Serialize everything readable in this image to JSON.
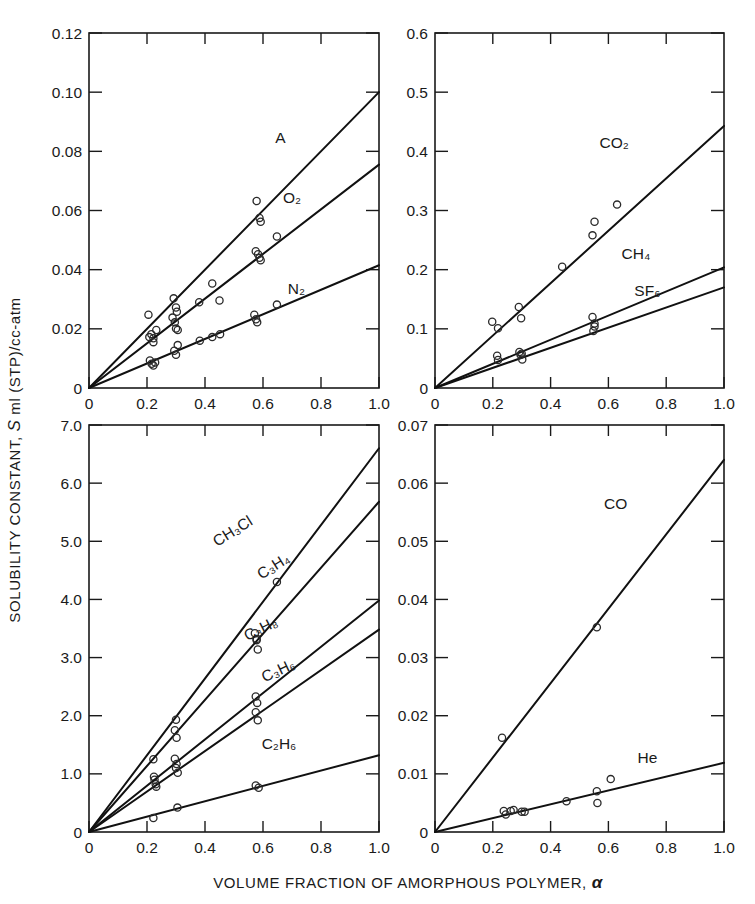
{
  "figure": {
    "xlabel_prefix": "VOLUME FRACTION OF AMORPHOUS POLYMER,",
    "xlabel_symbol": "α",
    "ylabel_part1": "SOLUBILITY CONSTANT,",
    "ylabel_symbol": "S",
    "ylabel_part2": "ml (STP)/cc-atm"
  },
  "chart_data": [
    {
      "id": "panel-top-left",
      "type": "scatter",
      "title": "",
      "xlabel": "VOLUME FRACTION OF AMORPHOUS POLYMER, α",
      "ylabel": "SOLUBILITY CONSTANT, S ml (STP)/cc-atm",
      "xlim": [
        0,
        1.0
      ],
      "ylim": [
        0,
        0.12
      ],
      "xticks": [
        0,
        0.2,
        0.4,
        0.6,
        0.8,
        1.0
      ],
      "xticklabels": [
        "0",
        "0.2",
        "0.4",
        "0.6",
        "0.8",
        "1.0"
      ],
      "yticks": [
        0,
        0.02,
        0.04,
        0.06,
        0.08,
        0.1,
        0.12
      ],
      "yticklabels": [
        "0",
        "0.02",
        "0.04",
        "0.06",
        "0.08",
        "0.10",
        "0.12"
      ],
      "grid": false,
      "legend_position": "inline-annotation",
      "series": [
        {
          "name": "A",
          "label": "A",
          "label_at": [
            0.66,
            0.083
          ],
          "fit_slope": 0.1,
          "fit_x": [
            0,
            1.0
          ],
          "fit_y": [
            0,
            0.1
          ],
          "points": [
            [
              0.205,
              0.0248
            ],
            [
              0.215,
              0.0182
            ],
            [
              0.222,
              0.0168
            ],
            [
              0.232,
              0.0196
            ],
            [
              0.292,
              0.0303
            ],
            [
              0.3,
              0.0272
            ],
            [
              0.303,
              0.0258
            ],
            [
              0.578,
              0.0632
            ],
            [
              0.588,
              0.0575
            ],
            [
              0.592,
              0.0562
            ]
          ]
        },
        {
          "name": "O2",
          "label": "O₂",
          "label_at": [
            0.7,
            0.0625
          ],
          "fit_slope": 0.0755,
          "fit_x": [
            0,
            1.0
          ],
          "fit_y": [
            0,
            0.0755
          ],
          "points": [
            [
              0.208,
              0.0172
            ],
            [
              0.222,
              0.0155
            ],
            [
              0.288,
              0.0238
            ],
            [
              0.296,
              0.0222
            ],
            [
              0.3,
              0.0201
            ],
            [
              0.306,
              0.0196
            ],
            [
              0.38,
              0.029
            ],
            [
              0.425,
              0.0353
            ],
            [
              0.45,
              0.0296
            ],
            [
              0.575,
              0.0462
            ],
            [
              0.583,
              0.0452
            ],
            [
              0.588,
              0.044
            ],
            [
              0.592,
              0.0432
            ],
            [
              0.648,
              0.0512
            ]
          ]
        },
        {
          "name": "N2",
          "label": "N₂",
          "label_at": [
            0.715,
            0.0318
          ],
          "fit_slope": 0.0415,
          "fit_x": [
            0,
            1.0
          ],
          "fit_y": [
            0,
            0.0415
          ],
          "points": [
            [
              0.21,
              0.0093
            ],
            [
              0.216,
              0.0082
            ],
            [
              0.222,
              0.0076
            ],
            [
              0.228,
              0.0086
            ],
            [
              0.294,
              0.0126
            ],
            [
              0.3,
              0.0112
            ],
            [
              0.306,
              0.0145
            ],
            [
              0.382,
              0.016
            ],
            [
              0.425,
              0.0172
            ],
            [
              0.452,
              0.0182
            ],
            [
              0.57,
              0.0248
            ],
            [
              0.576,
              0.0232
            ],
            [
              0.58,
              0.0222
            ],
            [
              0.648,
              0.0282
            ]
          ]
        }
      ]
    },
    {
      "id": "panel-top-right",
      "type": "scatter",
      "title": "",
      "xlabel": "VOLUME FRACTION OF AMORPHOUS POLYMER, α",
      "ylabel": "SOLUBILITY CONSTANT, S ml (STP)/cc-atm",
      "xlim": [
        0,
        1.0
      ],
      "ylim": [
        0,
        0.6
      ],
      "xticks": [
        0,
        0.2,
        0.4,
        0.6,
        0.8,
        1.0
      ],
      "xticklabels": [
        "0",
        "0.2",
        "0.4",
        "0.6",
        "0.8",
        "1.0"
      ],
      "yticks": [
        0,
        0.1,
        0.2,
        0.3,
        0.4,
        0.5,
        0.6
      ],
      "yticklabels": [
        "0",
        "0.1",
        "0.2",
        "0.3",
        "0.4",
        "0.5",
        "0.6"
      ],
      "grid": false,
      "legend_position": "inline-annotation",
      "series": [
        {
          "name": "CO2",
          "label": "CO₂",
          "label_at": [
            0.62,
            0.405
          ],
          "fit_slope": 0.443,
          "fit_x": [
            0,
            1.0
          ],
          "fit_y": [
            0,
            0.443
          ],
          "points": [
            [
              0.198,
              0.112
            ],
            [
              0.218,
              0.101
            ],
            [
              0.29,
              0.137
            ],
            [
              0.298,
              0.118
            ],
            [
              0.44,
              0.205
            ],
            [
              0.545,
              0.258
            ],
            [
              0.552,
              0.281
            ],
            [
              0.63,
              0.31
            ]
          ]
        },
        {
          "name": "CH4",
          "label": "CH₄",
          "label_at": [
            0.695,
            0.218
          ],
          "fit_slope": 0.204,
          "fit_x": [
            0,
            1.0
          ],
          "fit_y": [
            0,
            0.204
          ],
          "points": [
            [
              0.215,
              0.0545
            ],
            [
              0.292,
              0.061
            ],
            [
              0.3,
              0.058
            ],
            [
              0.545,
              0.12
            ],
            [
              0.552,
              0.109
            ]
          ]
        },
        {
          "name": "SF6",
          "label": "SF₆",
          "label_at": [
            0.735,
            0.155
          ],
          "fit_slope": 0.17,
          "fit_x": [
            0,
            1.0
          ],
          "fit_y": [
            0,
            0.17
          ],
          "points": [
            [
              0.218,
              0.0475
            ],
            [
              0.296,
              0.0562
            ],
            [
              0.302,
              0.048
            ],
            [
              0.548,
              0.0965
            ],
            [
              0.552,
              0.104
            ]
          ]
        }
      ]
    },
    {
      "id": "panel-bottom-left",
      "type": "scatter",
      "title": "",
      "xlabel": "VOLUME FRACTION OF AMORPHOUS POLYMER, α",
      "ylabel": "SOLUBILITY CONSTANT, S ml (STP)/cc-atm",
      "xlim": [
        0,
        1.0
      ],
      "ylim": [
        0,
        7.0
      ],
      "xticks": [
        0,
        0.2,
        0.4,
        0.6,
        0.8,
        1.0
      ],
      "xticklabels": [
        "0",
        "0.2",
        "0.4",
        "0.6",
        "0.8",
        "1.0"
      ],
      "yticks": [
        0,
        1.0,
        2.0,
        3.0,
        4.0,
        5.0,
        6.0,
        7.0
      ],
      "yticklabels": [
        "0",
        "1.0",
        "2.0",
        "3.0",
        "4.0",
        "5.0",
        "6.0",
        "7.0"
      ],
      "grid": false,
      "legend_position": "inline-annotation-rotated",
      "series": [
        {
          "name": "CH3Cl",
          "label": "CH₃Cl",
          "label_at": [
            0.505,
            5.1
          ],
          "label_rotation": -32,
          "fit_slope": 6.6,
          "fit_x": [
            0,
            1.0
          ],
          "fit_y": [
            0,
            6.6
          ],
          "points": [
            [
              0.222,
              1.25
            ],
            [
              0.3,
              1.93
            ],
            [
              0.572,
              3.42
            ],
            [
              0.578,
              3.3
            ],
            [
              0.648,
              4.3
            ]
          ]
        },
        {
          "name": "C3H4",
          "label": "C₃H₄",
          "label_at": [
            0.645,
            4.5
          ],
          "label_rotation": -32,
          "fit_slope": 5.68,
          "fit_x": [
            0,
            1.0
          ],
          "fit_y": [
            0,
            5.68
          ],
          "points": [
            [
              0.224,
              0.95
            ],
            [
              0.23,
              0.82
            ],
            [
              0.296,
              1.75
            ],
            [
              0.302,
              1.62
            ],
            [
              0.578,
              3.32
            ],
            [
              0.582,
              3.14
            ]
          ]
        },
        {
          "name": "C3H8",
          "label": "C₃H₈",
          "label_at": [
            0.6,
            3.42
          ],
          "label_rotation": -27,
          "fit_slope": 3.98,
          "fit_x": [
            0,
            1.0
          ],
          "fit_y": [
            0,
            3.98
          ],
          "points": [
            [
              0.226,
              0.9
            ],
            [
              0.296,
              1.26
            ],
            [
              0.302,
              1.17
            ],
            [
              0.575,
              2.33
            ],
            [
              0.58,
              2.22
            ]
          ]
        },
        {
          "name": "C3H6",
          "label": "C₃H₆",
          "label_at": [
            0.66,
            2.7
          ],
          "label_rotation": -25,
          "fit_slope": 3.48,
          "fit_x": [
            0,
            1.0
          ],
          "fit_y": [
            0,
            3.48
          ],
          "points": [
            [
              0.232,
              0.78
            ],
            [
              0.3,
              1.1
            ],
            [
              0.306,
              1.02
            ],
            [
              0.575,
              2.06
            ],
            [
              0.582,
              1.92
            ]
          ]
        },
        {
          "name": "C2H6",
          "label": "C₂H₆",
          "label_at": [
            0.655,
            1.42
          ],
          "label_rotation": 0,
          "fit_slope": 1.32,
          "fit_x": [
            0,
            1.0
          ],
          "fit_y": [
            0,
            1.32
          ],
          "points": [
            [
              0.222,
              0.24
            ],
            [
              0.305,
              0.42
            ],
            [
              0.575,
              0.8
            ],
            [
              0.585,
              0.76
            ]
          ]
        }
      ]
    },
    {
      "id": "panel-bottom-right",
      "type": "scatter",
      "title": "",
      "xlabel": "VOLUME FRACTION OF AMORPHOUS POLYMER, α",
      "ylabel": "SOLUBILITY CONSTANT, S ml (STP)/cc-atm",
      "xlim": [
        0,
        1.0
      ],
      "ylim": [
        0,
        0.07
      ],
      "xticks": [
        0,
        0.2,
        0.4,
        0.6,
        0.8,
        1.0
      ],
      "xticklabels": [
        "0",
        "0.2",
        "0.4",
        "0.6",
        "0.8",
        "1.0"
      ],
      "yticks": [
        0,
        0.01,
        0.02,
        0.03,
        0.04,
        0.05,
        0.06,
        0.07
      ],
      "yticklabels": [
        "0",
        "0.01",
        "0.02",
        "0.03",
        "0.04",
        "0.05",
        "0.06",
        "0.07"
      ],
      "grid": false,
      "legend_position": "inline-annotation",
      "series": [
        {
          "name": "CO",
          "label": "CO",
          "label_at": [
            0.625,
            0.0555
          ],
          "fit_slope": 0.064,
          "fit_x": [
            0,
            1.0
          ],
          "fit_y": [
            0,
            0.064
          ],
          "points": [
            [
              0.232,
              0.0162
            ],
            [
              0.56,
              0.0352
            ]
          ]
        },
        {
          "name": "He",
          "label": "He",
          "label_at": [
            0.735,
            0.0118
          ],
          "fit_slope": 0.0119,
          "fit_x": [
            0,
            1.0
          ],
          "fit_y": [
            0,
            0.0119
          ],
          "points": [
            [
              0.238,
              0.0036
            ],
            [
              0.245,
              0.003
            ],
            [
              0.262,
              0.0036
            ],
            [
              0.272,
              0.0038
            ],
            [
              0.3,
              0.0035
            ],
            [
              0.31,
              0.0035
            ],
            [
              0.455,
              0.0053
            ],
            [
              0.56,
              0.007
            ],
            [
              0.562,
              0.005
            ],
            [
              0.608,
              0.0091
            ]
          ]
        }
      ]
    }
  ]
}
